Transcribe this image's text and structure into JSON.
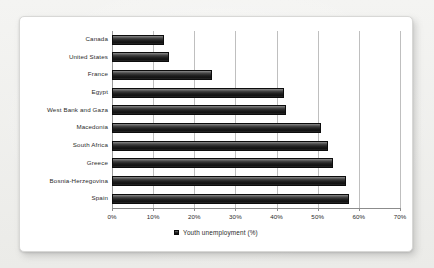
{
  "chart_data": {
    "type": "bar",
    "orientation": "horizontal",
    "title": "",
    "xlabel": "",
    "ylabel": "",
    "xlim": [
      0,
      70
    ],
    "grid": true,
    "legend_position": "bottom",
    "categories": [
      "Canada",
      "United States",
      "France",
      "Egypt",
      "West Bank and Gaza",
      "Macedonia",
      "South Africa",
      "Greece",
      "Bosnia-Herzegovina",
      "Spain"
    ],
    "values": [
      12.7,
      13.9,
      24.2,
      41.8,
      42.4,
      50.9,
      52.5,
      53.7,
      56.9,
      57.5
    ],
    "series": [
      {
        "name": "Youth unemployment (%)",
        "values": [
          12.7,
          13.9,
          24.2,
          41.8,
          42.4,
          50.9,
          52.5,
          53.7,
          56.9,
          57.5
        ]
      }
    ],
    "xticks": [
      0,
      10,
      20,
      30,
      40,
      50,
      60,
      70
    ],
    "xtick_labels": [
      "0%",
      "10%",
      "20%",
      "30%",
      "40%",
      "50%",
      "60%",
      "70%"
    ],
    "legend": [
      "Youth unemployment (%)"
    ],
    "colors": {
      "bar_dark": "#1b1b1b",
      "bar_highlight": "#8f8f8f",
      "gridline": "#bfbfbf",
      "axis": "#8c8c8c",
      "text": "#2b2b2b",
      "card_background": "#ffffff",
      "page_background": "#efefed"
    }
  }
}
